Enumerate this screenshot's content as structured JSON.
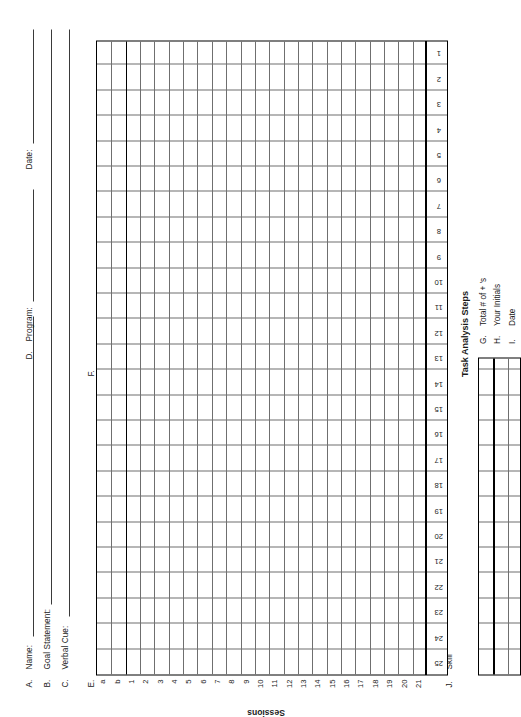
{
  "form": {
    "header_fields": [
      {
        "letter": "A.",
        "label": "Name:"
      },
      {
        "letter": "B.",
        "label": "Goal Statement:"
      },
      {
        "letter": "C.",
        "label": "Verbal Cue:"
      },
      {
        "letter": "D.",
        "label": "Program:"
      }
    ],
    "date_label": "Date:",
    "section_e_letter": "E.",
    "section_f_letter": "F.",
    "section_j_letter": "J.",
    "section_j_label": "Skill",
    "task_analysis_title": "Task Analysis Steps",
    "sessions_title": "Sessions",
    "step_numbers": [
      "25",
      "24",
      "23",
      "22",
      "21",
      "20",
      "19",
      "18",
      "17",
      "16",
      "15",
      "14",
      "13",
      "12",
      "11",
      "10",
      "9",
      "8",
      "7",
      "6",
      "5",
      "4",
      "3",
      "2",
      "1"
    ],
    "session_labels": [
      "a",
      "b",
      "1",
      "2",
      "3",
      "4",
      "5",
      "6",
      "7",
      "8",
      "9",
      "10",
      "11",
      "12",
      "13",
      "14",
      "15",
      "16",
      "17",
      "18",
      "19",
      "20",
      "21"
    ],
    "summary_rows": [
      {
        "letter": "G.",
        "label": "Total # of + 's"
      },
      {
        "letter": "H.",
        "label": "Your Initials"
      },
      {
        "letter": "I.",
        "label": "Date"
      }
    ],
    "colors": {
      "ink": "#1a1a1a",
      "grid_light": "#6f6f6f",
      "grid_heavy": "#000000",
      "paper": "#ffffff"
    }
  }
}
